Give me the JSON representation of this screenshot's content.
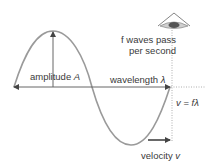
{
  "diagram": {
    "labels": {
      "amplitude": "amplitude",
      "amplitude_symbol": "A",
      "wavelength": "wavelength",
      "wavelength_symbol": "λ",
      "frequency_line1": "f waves pass",
      "frequency_line2": "per second",
      "equation_lhs": "v",
      "equation_eq": " = ",
      "equation_rhs": "fλ",
      "velocity": "velocity",
      "velocity_symbol": "v"
    },
    "colors": {
      "wave": "#9a9a9a",
      "arrow": "#555555",
      "dotted": "#9a9a9a",
      "eye": "#666666",
      "text": "#3a3a3a"
    },
    "icons": [
      "eye-icon"
    ]
  }
}
